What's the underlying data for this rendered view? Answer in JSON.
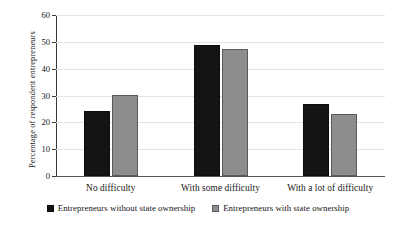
{
  "chart_data": {
    "type": "bar",
    "title": "",
    "xlabel": "",
    "ylabel": "Percentage of respondent entrepreneurs",
    "categories": [
      "No difficulty",
      "With some difficulty",
      "With a lot of difficulty"
    ],
    "series": [
      {
        "name": "Entrepreneurs without state ownership",
        "color": "#141414",
        "values": [
          24.3,
          49.0,
          26.8
        ]
      },
      {
        "name": "Entrepreneurs with state ownership",
        "color": "#8d8d8d",
        "values": [
          30.1,
          47.4,
          23.1
        ]
      }
    ],
    "ylim": [
      0,
      60
    ],
    "yticks": [
      "0",
      "10",
      "20",
      "30",
      "40",
      "50",
      "60"
    ],
    "ytick_values": [
      0,
      10,
      20,
      30,
      40,
      50,
      60
    ],
    "grid": true,
    "legend_position": "bottom"
  },
  "axis": {
    "y_title": "Percentage of respondent entrepreneurs"
  },
  "legend": {
    "items": [
      {
        "label": "Entrepreneurs without state ownership",
        "swatch": "dark-square-swatch"
      },
      {
        "label": "Entrepreneurs with state ownership",
        "swatch": "light-square-swatch"
      }
    ]
  }
}
